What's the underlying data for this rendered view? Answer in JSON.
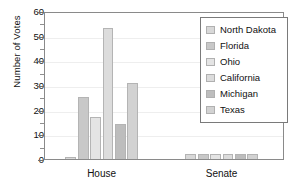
{
  "chart_data": {
    "type": "bar",
    "title": "",
    "xlabel": "",
    "ylabel": "Number of Votes",
    "categories": [
      "House",
      "Senate"
    ],
    "ylim": [
      0,
      60
    ],
    "ytick_labels": [
      "0",
      "10",
      "20",
      "30",
      "40",
      "50",
      "60"
    ],
    "ytick_values": [
      0,
      10,
      20,
      30,
      40,
      50,
      60
    ],
    "yminor_values": [
      5,
      15,
      25,
      35,
      45,
      55
    ],
    "grid": true,
    "legend_position": "upper right",
    "series": [
      {
        "name": "North Dakota",
        "values": [
          1,
          2
        ],
        "color": "#d8d8d8"
      },
      {
        "name": "Florida",
        "values": [
          25,
          2
        ],
        "color": "#c8c8c8"
      },
      {
        "name": "Ohio",
        "values": [
          17,
          2
        ],
        "color": "#e4e4e4"
      },
      {
        "name": "California",
        "values": [
          53,
          2
        ],
        "color": "#dcdcdc"
      },
      {
        "name": "Michigan",
        "values": [
          14,
          2
        ],
        "color": "#bdbdbd"
      },
      {
        "name": "Texas",
        "values": [
          31,
          2
        ],
        "color": "#d2d2d2"
      }
    ]
  },
  "legend": {
    "items": [
      {
        "label": "North Dakota"
      },
      {
        "label": "Florida"
      },
      {
        "label": "Ohio"
      },
      {
        "label": "California"
      },
      {
        "label": "Michigan"
      },
      {
        "label": "Texas"
      }
    ]
  }
}
